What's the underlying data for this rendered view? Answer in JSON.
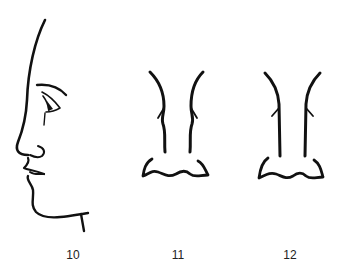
{
  "figure": {
    "ink_color": "#111111",
    "background": "#ffffff",
    "panels": [
      {
        "id": "profile",
        "label": "10",
        "view": "side profile of face"
      },
      {
        "id": "front-a",
        "label": "11",
        "view": "frontal nose"
      },
      {
        "id": "front-b",
        "label": "12",
        "view": "frontal nose (straighter bridge)"
      }
    ]
  }
}
